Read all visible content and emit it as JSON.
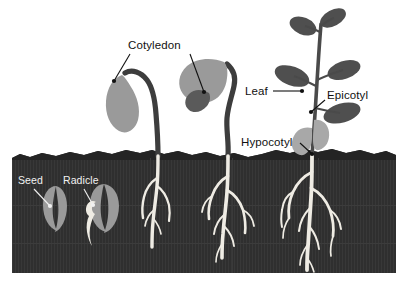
{
  "figure": {
    "background_color": "#ffffff",
    "width": 409,
    "height": 290
  },
  "colors": {
    "soil": "#2f2f2f",
    "soil_top_band": "#262626",
    "soil_texture": "#3a3a3a",
    "root": "#efece4",
    "seed_light": "#9a9a9a",
    "cotyledon_light": "#9a9a9a",
    "leaf_dark": "#4a4a4a",
    "stem_dark": "#3d3d3d",
    "stem_light": "#c9c9c9",
    "label_dark": "#111111",
    "label_light": "#f2f2f2",
    "page": "#ffffff"
  },
  "labels": [
    {
      "id": "cotyledon",
      "text": "Cotyledon",
      "color": "#111111",
      "x": 128,
      "y": 49,
      "anchor": "start"
    },
    {
      "id": "leaf",
      "text": "Leaf",
      "color": "#111111",
      "x": 245,
      "y": 95,
      "anchor": "start"
    },
    {
      "id": "epicotyl",
      "text": "Epicotyl",
      "color": "#111111",
      "x": 327,
      "y": 99,
      "anchor": "start"
    },
    {
      "id": "hypocotyl",
      "text": "Hypocotyl",
      "color": "#111111",
      "x": 241,
      "y": 146,
      "anchor": "start"
    },
    {
      "id": "seed",
      "text": "Seed",
      "color": "#f2f2f2",
      "x": 18,
      "y": 184,
      "anchor": "start"
    },
    {
      "id": "radicle",
      "text": "Radicle",
      "color": "#f2f2f2",
      "x": 63,
      "y": 184,
      "anchor": "start"
    }
  ],
  "stages": [
    {
      "id": "stage-1-seed",
      "name": "Dormant seed",
      "description": "Ungerminated seed buried in soil"
    },
    {
      "id": "stage-2-radicle",
      "name": "Radicle emergence",
      "description": "Seed with radicle root emerging downward"
    },
    {
      "id": "stage-3-hook",
      "name": "Hypocotyl hook",
      "description": "Arched hypocotyl pulling cotyledon upward through soil"
    },
    {
      "id": "stage-4-cotyledon",
      "name": "Cotyledon expansion",
      "description": "Cotyledon opened above soil with first leaf"
    },
    {
      "id": "stage-5-seedling",
      "name": "Mature seedling",
      "description": "Leafy seedling with epicotyl, leaves and branched root system"
    }
  ],
  "soil": {
    "label": "Soil cross-section",
    "left": 12,
    "right": 396,
    "top": 150,
    "bottom": 273
  }
}
